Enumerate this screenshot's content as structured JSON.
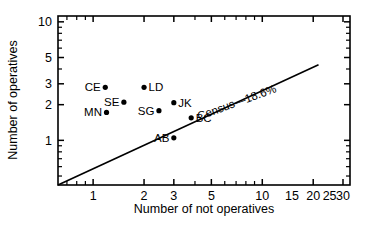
{
  "chart_data": {
    "type": "scatter",
    "title": "",
    "xlabel": "Number of not operatives",
    "ylabel": "Number of operatives",
    "xscale": "log",
    "yscale": "log",
    "xlim": [
      0.62,
      33
    ],
    "ylim": [
      0.42,
      11.2
    ],
    "grid": false,
    "legend": null,
    "xticks": [
      1,
      2,
      3,
      5,
      10,
      15,
      20,
      25,
      30
    ],
    "xticklabels": [
      "1",
      "2",
      "3",
      "5",
      "10",
      "15",
      "20",
      "25",
      "30"
    ],
    "yticks": [
      1,
      2,
      3,
      5,
      10
    ],
    "yticklabels": [
      "1",
      "2",
      "3",
      "5",
      "10"
    ],
    "points": [
      {
        "label": "CE",
        "x": 1.18,
        "y": 2.8,
        "label_side": "left"
      },
      {
        "label": "SE",
        "x": 1.52,
        "y": 2.1,
        "label_side": "left"
      },
      {
        "label": "LD",
        "x": 2.0,
        "y": 2.8,
        "label_side": "right"
      },
      {
        "label": "MN",
        "x": 1.2,
        "y": 1.72,
        "label_side": "left"
      },
      {
        "label": "JK",
        "x": 3.0,
        "y": 2.08,
        "label_side": "right"
      },
      {
        "label": "SG",
        "x": 2.45,
        "y": 1.78,
        "label_side": "left"
      },
      {
        "label": "BC",
        "x": 3.8,
        "y": 1.55,
        "label_side": "right"
      },
      {
        "label": "AB",
        "x": 3.0,
        "y": 1.05,
        "label_side": "left"
      }
    ],
    "annotations": [
      {
        "name": "census-line-label",
        "text": "Census—18.6%",
        "x": 7.2,
        "y": 1.95,
        "rotation": -20
      }
    ],
    "reference_line": {
      "name": "census-reference-line",
      "label": "Census—18.6%",
      "slope_percent": 18.6,
      "from": {
        "x": 0.62,
        "y": 0.42
      },
      "to": {
        "x": 21.5,
        "y": 4.35
      }
    }
  }
}
